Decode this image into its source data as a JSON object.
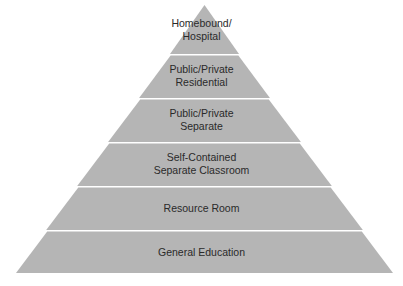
{
  "diagram": {
    "type": "pyramid",
    "fill_color": "#b5b5b5",
    "separator_color": "#ffffff",
    "text_color": "#2a2a2a",
    "layers_top_to_bottom": [
      {
        "label": "Homebound/\nHospital"
      },
      {
        "label": "Public/Private\nResidential"
      },
      {
        "label": "Public/Private\nSeparate"
      },
      {
        "label": "Self-Contained\nSeparate Classroom"
      },
      {
        "label": "Resource Room"
      },
      {
        "label": "General Education"
      }
    ]
  }
}
